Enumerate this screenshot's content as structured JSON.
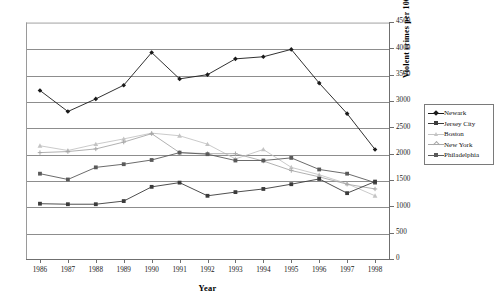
{
  "chart_data": {
    "type": "line",
    "title": "",
    "xlabel": "Year",
    "ylabel": "Violent crimes per 100,000",
    "x": [
      1986,
      1987,
      1988,
      1989,
      1990,
      1991,
      1992,
      1993,
      1994,
      1995,
      1996,
      1997,
      1998
    ],
    "categories": [
      "1986",
      "1987",
      "1988",
      "1989",
      "1990",
      "1991",
      "1992",
      "1993",
      "1994",
      "1995",
      "1996",
      "1997",
      "1998"
    ],
    "ylim": [
      0,
      4500
    ],
    "yticks": [
      0,
      500,
      1000,
      1500,
      2000,
      2500,
      3000,
      3500,
      4000,
      4500
    ],
    "ytick_labels": [
      "0",
      "500",
      "1000",
      "1500",
      "2000",
      "2500",
      "3000",
      "3500",
      "4000",
      "4500"
    ],
    "grid": "horizontal",
    "legend_position": "right",
    "series": [
      {
        "name": "Newark",
        "color": "#1a1a1a",
        "marker": "diamond",
        "values": [
          3200,
          2800,
          3040,
          3300,
          3920,
          3420,
          3500,
          3800,
          3840,
          3980,
          3340,
          2760,
          2080
        ]
      },
      {
        "name": "Jersey City",
        "color": "#3b3b3b",
        "marker": "square",
        "values": [
          1050,
          1040,
          1040,
          1100,
          1370,
          1450,
          1200,
          1270,
          1330,
          1420,
          1520,
          1250,
          1470
        ]
      },
      {
        "name": "Boston",
        "color": "#c4c4c4",
        "marker": "triangle",
        "values": [
          2150,
          2060,
          2180,
          2280,
          2390,
          2340,
          2180,
          1900,
          2080,
          1740,
          1600,
          1430,
          1200
        ]
      },
      {
        "name": "New York",
        "color": "#a8a8a8",
        "marker": "cross",
        "values": [
          2020,
          2040,
          2090,
          2220,
          2380,
          2020,
          2000,
          2000,
          1860,
          1680,
          1560,
          1420,
          1330
        ]
      },
      {
        "name": "Philadelphia",
        "color": "#5a5a5a",
        "marker": "square",
        "values": [
          1620,
          1510,
          1740,
          1800,
          1880,
          2020,
          1990,
          1870,
          1870,
          1920,
          1700,
          1620,
          1450
        ]
      }
    ]
  }
}
